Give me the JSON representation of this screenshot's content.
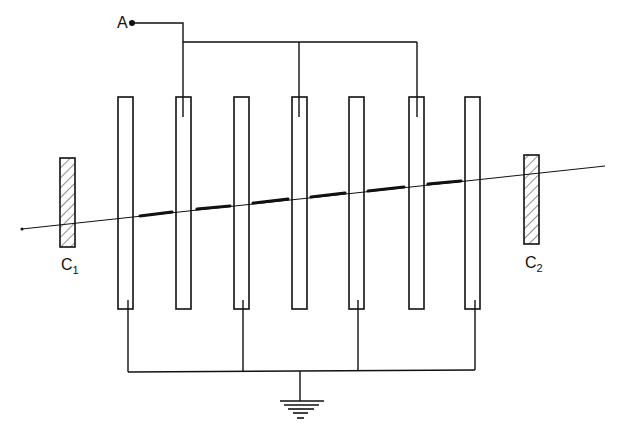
{
  "diagram": {
    "terminal_label": "A",
    "collector_left": {
      "label": "C",
      "subscript": "1"
    },
    "collector_right": {
      "label": "C",
      "subscript": "2"
    },
    "plates": {
      "count": 7,
      "x_positions": [
        118,
        176,
        234,
        292,
        349,
        409,
        465
      ],
      "width": 15,
      "top": 97,
      "bottom": 309,
      "connected_to_A": [
        1,
        3,
        5
      ],
      "connected_to_ground": [
        0,
        2,
        4,
        6
      ]
    },
    "ground_symbol": "ground-icon",
    "colors": {
      "line": "#111111",
      "background": "#ffffff"
    }
  }
}
